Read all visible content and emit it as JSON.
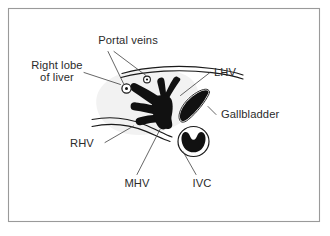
{
  "figure": {
    "background_color": "#ffffff",
    "frame_color": "#9a9a9a",
    "vessel_color": "#111111",
    "outline_color": "#1a1a1a",
    "leader_color": "#4a4a4a",
    "text_color": "#2b2b2b",
    "wash_color": "#f2f2f2"
  },
  "labels": {
    "portal_veins": "Portal veins",
    "right_lobe_line1": "Right lobe",
    "right_lobe_line2": "of liver",
    "lhv": "LHV",
    "gallbladder": "Gallbladder",
    "rhv": "RHV",
    "mhv": "MHV",
    "ivc": "IVC"
  },
  "structures": [
    {
      "name": "right-lobe-of-liver",
      "label": "Right lobe of liver"
    },
    {
      "name": "portal-veins",
      "label": "Portal veins"
    },
    {
      "name": "left-hepatic-vein",
      "label": "LHV"
    },
    {
      "name": "middle-hepatic-vein",
      "label": "MHV"
    },
    {
      "name": "right-hepatic-vein",
      "label": "RHV"
    },
    {
      "name": "gallbladder",
      "label": "Gallbladder"
    },
    {
      "name": "inferior-vena-cava",
      "label": "IVC"
    }
  ]
}
